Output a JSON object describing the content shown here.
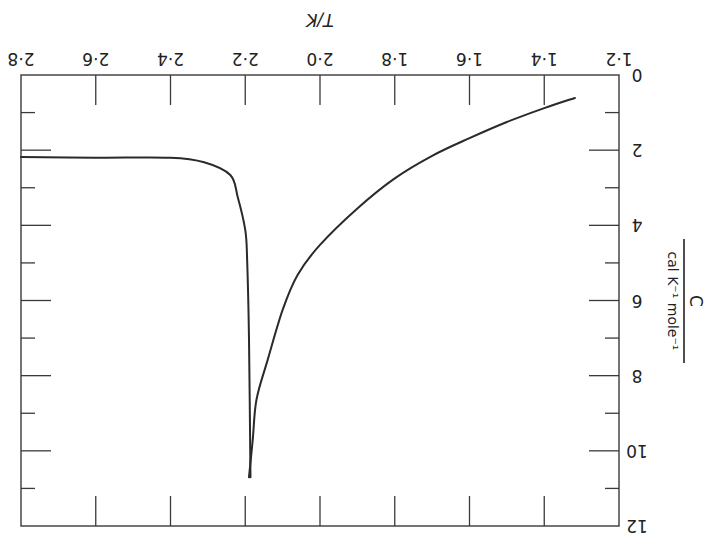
{
  "chart_data": {
    "type": "line",
    "title": "",
    "orientation_note": "figure rendered rotated 180 degrees",
    "xlabel": "T/K",
    "ylabel": "C / cal K^-1 mole^-1",
    "ylabel_parts": {
      "numerator": "C",
      "denominator": "cal K⁻¹ mole⁻¹"
    },
    "xlim": [
      1.2,
      2.8
    ],
    "ylim": [
      0,
      12
    ],
    "grid": false,
    "legend": null,
    "x_ticks": [
      "1·2",
      "1·4",
      "1·6",
      "1·8",
      "2·0",
      "2·2",
      "2·4",
      "2·6",
      "2·8"
    ],
    "x_tick_values": [
      1.2,
      1.4,
      1.6,
      1.8,
      2.0,
      2.2,
      2.4,
      2.6,
      2.8
    ],
    "y_ticks": [
      "0",
      "2",
      "4",
      "6",
      "8",
      "10",
      "12"
    ],
    "y_tick_values": [
      0,
      2,
      4,
      6,
      8,
      10,
      12
    ],
    "y_minor_ticks": [
      1,
      3,
      5,
      7,
      9,
      11
    ],
    "series": [
      {
        "name": "below lambda point (superfluid branch)",
        "x": [
          1.318,
          1.4,
          1.5,
          1.6,
          1.7,
          1.8,
          1.9,
          2.0,
          2.06,
          2.1,
          2.14,
          2.17,
          2.18,
          2.19
        ],
        "y": [
          0.61,
          0.88,
          1.25,
          1.68,
          2.15,
          2.75,
          3.55,
          4.52,
          5.32,
          6.25,
          7.58,
          8.64,
          9.71,
          10.7
        ]
      },
      {
        "name": "above lambda point (normal branch)",
        "x": [
          2.186,
          2.19,
          2.195,
          2.2,
          2.22,
          2.24,
          2.31,
          2.4,
          2.6,
          2.8
        ],
        "y": [
          10.7,
          7.0,
          4.9,
          4.12,
          3.25,
          2.66,
          2.32,
          2.2,
          2.2,
          2.18
        ]
      }
    ],
    "annotations": [
      "lambda transition near T = 2.19 K"
    ]
  }
}
